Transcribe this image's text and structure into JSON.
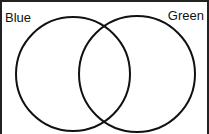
{
  "diagram": {
    "type": "venn",
    "sets": [
      {
        "label": "Blue",
        "cx": 73,
        "cy": 74,
        "r": 57
      },
      {
        "label": "Green",
        "cx": 137,
        "cy": 74,
        "r": 58
      }
    ],
    "stroke_color": "#111111"
  }
}
